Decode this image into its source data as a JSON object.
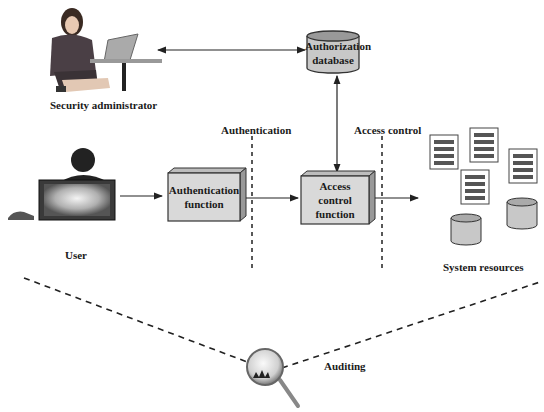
{
  "diagram": {
    "actors": {
      "admin": {
        "label": "Security administrator"
      },
      "user": {
        "label": "User"
      }
    },
    "components": {
      "auth_db": {
        "label_line1": "Authorization",
        "label_line2": "database"
      },
      "auth_fn": {
        "label_line1": "Authentication",
        "label_line2": "function"
      },
      "ac_fn": {
        "label_line1": "Access",
        "label_line2": "control",
        "label_line3": "function"
      },
      "resources": {
        "label": "System resources"
      }
    },
    "boundaries": {
      "authentication": "Authentication",
      "access_control": "Access control"
    },
    "auditing": {
      "label": "Auditing"
    },
    "colors": {
      "box_fill": "#d9d9d9",
      "box_stroke": "#333333",
      "db_fill": "#c8c8c8",
      "line": "#222222",
      "doc_bar": "#555555"
    }
  }
}
